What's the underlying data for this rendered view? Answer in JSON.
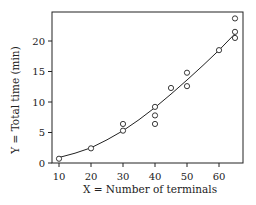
{
  "chart_data": {
    "type": "scatter",
    "title": "",
    "xlabel": "X = Number of terminals",
    "ylabel": "Y = Total time (min)",
    "xlim": [
      7,
      67
    ],
    "ylim": [
      0,
      25
    ],
    "xticks": [
      10,
      20,
      30,
      40,
      50,
      60
    ],
    "yticks": [
      0,
      5,
      10,
      15,
      20
    ],
    "grid": false,
    "legend": null,
    "series": [
      {
        "name": "observations",
        "marker": "open-circle",
        "x": [
          10,
          20,
          30,
          30,
          40,
          40,
          40,
          45,
          50,
          50,
          60,
          65,
          65,
          65
        ],
        "y": [
          0.7,
          2.4,
          6.4,
          5.3,
          9.2,
          7.8,
          6.4,
          12.3,
          14.8,
          12.6,
          18.5,
          23.7,
          21.5,
          20.5
        ]
      },
      {
        "name": "fitted curve",
        "style": "line",
        "x": [
          10,
          15,
          20,
          25,
          30,
          35,
          40,
          45,
          50,
          55,
          60,
          65
        ],
        "y": [
          0.9,
          1.6,
          2.5,
          3.8,
          5.3,
          7.1,
          9.1,
          11.3,
          13.6,
          16.0,
          18.5,
          21.2
        ]
      }
    ]
  },
  "colors": {
    "ink": "#222222",
    "background": "#ffffff"
  }
}
